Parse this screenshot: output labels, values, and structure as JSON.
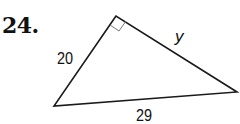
{
  "problem": {
    "number": "24."
  },
  "triangle": {
    "type": "right-triangle",
    "right_angle_at": "top vertex",
    "vertices": {
      "top": [
        116,
        16
      ],
      "bottom_left": [
        54,
        106
      ],
      "right": [
        237,
        92
      ]
    },
    "sides": {
      "left_leg": "20",
      "right_leg": "y",
      "hypotenuse": "29"
    },
    "stroke_color": "#1a1a1a",
    "marker_color": "#777777"
  }
}
